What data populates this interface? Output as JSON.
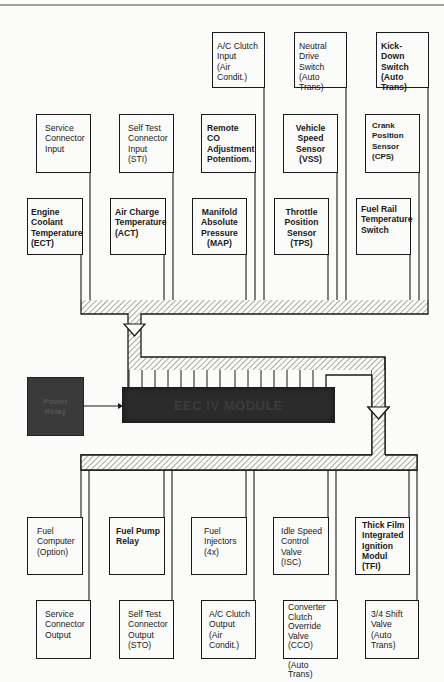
{
  "diagram": {
    "module_label": "EEC IV MODULE",
    "power_relay_label": "Power\nRelay",
    "inputs": {
      "row1": [
        {
          "id": "ac-clutch-input",
          "label": "A/C Clutch\nInput\n(Air Condit.)"
        },
        {
          "id": "neutral-drive-switch",
          "label": "Neutral\nDrive Switch\n(Auto Trans)"
        },
        {
          "id": "kick-down-switch",
          "label": "Kick-Down\nSwitch\n(Auto Trans)"
        }
      ],
      "row2": [
        {
          "id": "service-connector-input",
          "label": "Service\nConnector\nInput"
        },
        {
          "id": "self-test-connector-input",
          "label": "Self Test\nConnector\nInput\n(STI)"
        },
        {
          "id": "remote-co-adjustment",
          "label": "Remote CO\nAdjustment\nPotentiom."
        },
        {
          "id": "vehicle-speed-sensor",
          "label": "Vehicle\nSpeed\nSensor\n(VSS)"
        },
        {
          "id": "crank-position-sensor",
          "label": "Crank\nPosition\nSensor\n(CPS)"
        }
      ],
      "row3": [
        {
          "id": "engine-coolant-temperature",
          "label": "Engine\nCoolant\nTemperature\n(ECT)"
        },
        {
          "id": "air-charge-temperature",
          "label": "Air Charge\nTemperature\n(ACT)"
        },
        {
          "id": "manifold-absolute-pressure",
          "label": "Manifold\nAbsolute\nPressure\n(MAP)"
        },
        {
          "id": "throttle-position-sensor",
          "label": "Throttle\nPosition\nSensor\n(TPS)"
        },
        {
          "id": "fuel-rail-temperature-switch",
          "label": "Fuel Rail\nTemperature\nSwitch"
        }
      ]
    },
    "outputs": {
      "row1": [
        {
          "id": "fuel-computer",
          "label": "Fuel\nComputer\n(Option)"
        },
        {
          "id": "fuel-pump-relay",
          "label": "Fuel Pump\nRelay"
        },
        {
          "id": "fuel-injectors",
          "label": "Fuel\nInjectors\n(4x)"
        },
        {
          "id": "idle-speed-control-valve",
          "label": "Idle Speed\nControl\nValve\n(ISC)"
        },
        {
          "id": "thick-film-ignition-module",
          "label": "Thick Film\nIntegrated\nIgnition\nModul\n(TFI)"
        }
      ],
      "row2": [
        {
          "id": "service-connector-output",
          "label": "Service\nConnector\nOutput"
        },
        {
          "id": "self-test-connector-output",
          "label": "Self Test\nConnector\nOutput\n(STO)"
        },
        {
          "id": "ac-clutch-output",
          "label": "A/C Clutch\nOutput\n(Air Condit.)"
        },
        {
          "id": "converter-clutch-override-valve",
          "label": "Converter\nClutch\nOverride\nValve (CCO)\n\n(Auto Trans)"
        },
        {
          "id": "shift-valve-3-4",
          "label": "3/4 Shift\nValve\n(Auto Trans)"
        }
      ]
    }
  }
}
